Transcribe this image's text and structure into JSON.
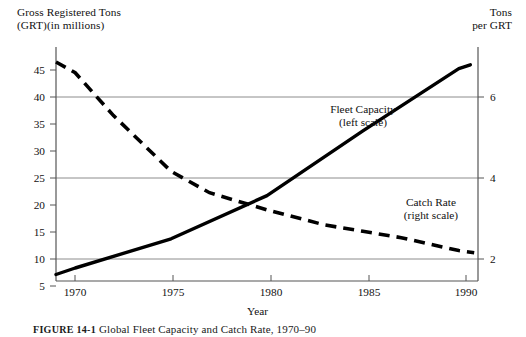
{
  "chart_data": {
    "type": "line",
    "title": "FIGURE 14-1  Global Fleet Capacity and Catch Rate, 1970–90",
    "xlabel": "Year",
    "ylabel": "Gross Registered Tons (GRT)(in millions)",
    "y2label": "Tons per GRT",
    "grid": true,
    "legend_position": "inline-annotations",
    "xlim": [
      1969,
      1991
    ],
    "ylim": [
      3.2,
      46.5
    ],
    "y2lim": [
      1.44,
      6.9
    ],
    "xticks": [
      1970,
      1975,
      1980,
      1985,
      1990
    ],
    "xtick_labels": [
      "1970",
      "1975",
      "1980",
      "1985",
      "1990"
    ],
    "yticks": [
      5,
      10,
      15,
      20,
      25,
      30,
      35,
      40,
      45
    ],
    "ytick_labels": [
      "5",
      "10",
      "15",
      "20",
      "25",
      "30",
      "35",
      "40",
      "45"
    ],
    "y2ticks": [
      2,
      4,
      6
    ],
    "y2tick_labels": [
      "2",
      "4",
      "6"
    ],
    "gridlines_left": [
      10,
      25,
      40
    ],
    "series": [
      {
        "name": "Fleet Capacity",
        "axis": "left",
        "style": "solid",
        "annotation": "Fleet Capacity\n(left scale)",
        "x": [
          1969,
          1970,
          1975,
          1980,
          1985,
          1990,
          1990.6
        ],
        "values": [
          4.4,
          5.6,
          11.0,
          19.0,
          31.0,
          42.5,
          43.2
        ]
      },
      {
        "name": "Catch Rate",
        "axis": "right",
        "style": "dashed",
        "annotation": "Catch Rate\n(right scale)",
        "x": [
          1969,
          1970,
          1972,
          1975,
          1977,
          1980,
          1983,
          1985,
          1987,
          1990,
          1990.8
        ],
        "values": [
          6.55,
          6.3,
          5.3,
          4.0,
          3.5,
          3.1,
          2.75,
          2.6,
          2.45,
          2.15,
          2.1
        ]
      }
    ]
  },
  "axis_titles": {
    "left": "Gross Registered Tons\n(GRT)(in millions)",
    "right": "Tons\nper GRT",
    "x": "Year"
  },
  "annotations": {
    "fleet_capacity": "Fleet Capacity\n(left scale)",
    "catch_rate": "Catch Rate\n(right scale)"
  },
  "caption": {
    "figure_number": "FIGURE 14-1",
    "text": "Global Fleet Capacity and Catch Rate, 1970–90"
  },
  "colors": {
    "line": "#000000",
    "grid": "#8c8c8c",
    "axis": "#555555",
    "text": "#111111",
    "background": "#ffffff"
  }
}
